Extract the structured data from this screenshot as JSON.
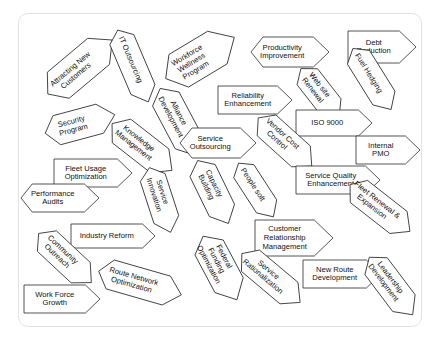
{
  "diagram": {
    "type": "arrow-shape-collage",
    "canvas": {
      "width": 440,
      "height": 340
    },
    "board": {
      "x": 18,
      "y": 13,
      "width": 404,
      "height": 314,
      "background": "#ffffff",
      "border_color": "#e2e2e2",
      "corner_radius": 10
    },
    "style": {
      "shape_fill": "#ffffff",
      "shape_stroke": "#2a2a2a",
      "stroke_width": 0.8,
      "label_color": "#101010",
      "label_font_size": 7.6
    },
    "arrow_count": 30,
    "arrows": [
      {
        "id": "attracting-new-customers",
        "label": "Attracting New\nCustomers",
        "cx": 80,
        "cy": 67,
        "w": 84,
        "h": 34,
        "rot": -40,
        "tail": 0
      },
      {
        "id": "it-outsourcing",
        "label": "IT Outsourcing",
        "cx": 133,
        "cy": 66,
        "w": 78,
        "h": 26,
        "rot": 67,
        "tail": 0
      },
      {
        "id": "workforce-wellness",
        "label": "Workforce\nWellness\nProgram",
        "cx": 200,
        "cy": 58,
        "w": 80,
        "h": 38,
        "rot": -31,
        "tail": 0
      },
      {
        "id": "productivity-improvement",
        "label": "Productivity\nImprovement",
        "cx": 290,
        "cy": 52,
        "w": 78,
        "h": 30,
        "rot": 0,
        "tail": 0
      },
      {
        "id": "debt-reduction",
        "label": "Debt\nReduction",
        "cx": 382,
        "cy": 47,
        "w": 68,
        "h": 32,
        "rot": 0,
        "tail": 1
      },
      {
        "id": "fuel-hedging",
        "label": "Fuel Hedging",
        "cx": 372,
        "cy": 79,
        "w": 72,
        "h": 26,
        "rot": 58,
        "tail": 0
      },
      {
        "id": "alliance-development",
        "label": "Alliance\nDevelopment",
        "cx": 178,
        "cy": 122,
        "w": 76,
        "h": 30,
        "rot": 62,
        "tail": 0
      },
      {
        "id": "reliability-enhancement",
        "label": "Reliability\nEnhancement",
        "cx": 255,
        "cy": 100,
        "w": 74,
        "h": 28,
        "rot": 0,
        "tail": 1
      },
      {
        "id": "web-site-renewal",
        "label": "Web site\nRenewal",
        "cx": 320,
        "cy": 93,
        "w": 62,
        "h": 26,
        "rot": 52,
        "tail": 0
      },
      {
        "id": "iso-9000",
        "label": "ISO 9000",
        "cx": 334,
        "cy": 123,
        "w": 76,
        "h": 26,
        "rot": 0,
        "tail": 1
      },
      {
        "id": "security-program",
        "label": "Security\nProgram",
        "cx": 80,
        "cy": 124,
        "w": 72,
        "h": 30,
        "rot": -15,
        "tail": 0
      },
      {
        "id": "knowledge-management",
        "label": "Knowledge\nManagement",
        "cx": 142,
        "cy": 147,
        "w": 76,
        "h": 30,
        "rot": 38,
        "tail": 0
      },
      {
        "id": "service-outsourcing",
        "label": "Service\nOutsourcing",
        "cx": 218,
        "cy": 143,
        "w": 76,
        "h": 30,
        "rot": 0,
        "tail": 0
      },
      {
        "id": "vendor-cost-control",
        "label": "Vendor Cost\nControl",
        "cx": 285,
        "cy": 142,
        "w": 72,
        "h": 28,
        "rot": 42,
        "tail": 0
      },
      {
        "id": "internal-pmo",
        "label": "Internal\nPMO",
        "cx": 388,
        "cy": 150,
        "w": 64,
        "h": 28,
        "rot": 0,
        "tail": 1
      },
      {
        "id": "fleet-usage-optimization",
        "label": "Fleet Usage\nOptimization",
        "cx": 93,
        "cy": 173,
        "w": 78,
        "h": 28,
        "rot": 0,
        "tail": 1
      },
      {
        "id": "service-quality-enhancement",
        "label": "Service Quality\nEnhancement",
        "cx": 338,
        "cy": 180,
        "w": 84,
        "h": 28,
        "rot": 0,
        "tail": 1
      },
      {
        "id": "performance-audits",
        "label": "Performance\nAudits",
        "cx": 60,
        "cy": 198,
        "w": 78,
        "h": 28,
        "rot": 0,
        "tail": 0
      },
      {
        "id": "service-innovation",
        "label": "Service\nInnovation",
        "cx": 160,
        "cy": 200,
        "w": 68,
        "h": 26,
        "rot": 72,
        "tail": 0
      },
      {
        "id": "capacity-building",
        "label": "Capacity\nBuilding",
        "cx": 213,
        "cy": 192,
        "w": 70,
        "h": 28,
        "rot": 64,
        "tail": 0
      },
      {
        "id": "people-soft",
        "label": "People soft",
        "cx": 256,
        "cy": 190,
        "w": 64,
        "h": 24,
        "rot": 57,
        "tail": 0
      },
      {
        "id": "fleet-renewal-expansion",
        "label": "Fleet Renewal &\nExpansion",
        "cx": 380,
        "cy": 208,
        "w": 76,
        "h": 28,
        "rot": 38,
        "tail": 0
      },
      {
        "id": "industry-reform",
        "label": "Industry Reform",
        "cx": 113,
        "cy": 236,
        "w": 84,
        "h": 24,
        "rot": 0,
        "tail": 1
      },
      {
        "id": "customer-relationship-management",
        "label": "Customer\nRelationship\nManagement",
        "cx": 294,
        "cy": 238,
        "w": 78,
        "h": 36,
        "rot": 0,
        "tail": 1
      },
      {
        "id": "community-outreach",
        "label": "Community\nOutreach",
        "cx": 65,
        "cy": 258,
        "w": 72,
        "h": 28,
        "rot": 43,
        "tail": 0
      },
      {
        "id": "federal-funding-optimization",
        "label": "Federal\nFunding\nOptimization",
        "cx": 220,
        "cy": 268,
        "w": 72,
        "h": 32,
        "rot": 62,
        "tail": 0
      },
      {
        "id": "service-rationalization",
        "label": "Service\nRationalization",
        "cx": 271,
        "cy": 278,
        "w": 76,
        "h": 28,
        "rot": 40,
        "tail": 0
      },
      {
        "id": "new-route-development",
        "label": "New Route\nDevelopment",
        "cx": 342,
        "cy": 274,
        "w": 78,
        "h": 28,
        "rot": 0,
        "tail": 1
      },
      {
        "id": "leadership-development",
        "label": "Leadership\nDevelopment",
        "cx": 391,
        "cy": 286,
        "w": 72,
        "h": 28,
        "rot": 53,
        "tail": 0
      },
      {
        "id": "route-network-optimization",
        "label": "Route Network\nOptimization",
        "cx": 140,
        "cy": 283,
        "w": 86,
        "h": 30,
        "rot": 16,
        "tail": 0
      },
      {
        "id": "work-force-growth",
        "label": "Work Force\nGrowth",
        "cx": 62,
        "cy": 299,
        "w": 76,
        "h": 28,
        "rot": 0,
        "tail": 1
      }
    ]
  }
}
